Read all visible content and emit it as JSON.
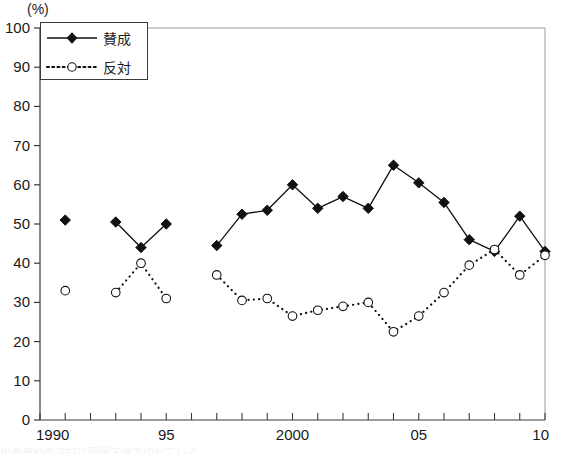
{
  "chart_data": {
    "type": "line",
    "title": "",
    "subtitle": "",
    "xlabel": "",
    "ylabel": "",
    "unit_label": "(%)",
    "xlim": [
      1990,
      2010
    ],
    "ylim": [
      0,
      100
    ],
    "grid": false,
    "legend_position": "top-left",
    "y_ticks": [
      0,
      10,
      20,
      30,
      40,
      50,
      60,
      70,
      80,
      90,
      100
    ],
    "y_tick_labels": [
      "0",
      "10",
      "20",
      "30",
      "40",
      "50",
      "60",
      "70",
      "80",
      "90",
      "100"
    ],
    "x_ticks": [
      1990,
      1991,
      1992,
      1993,
      1994,
      1995,
      1996,
      1997,
      1998,
      1999,
      2000,
      2001,
      2002,
      2003,
      2004,
      2005,
      2006,
      2007,
      2008,
      2009,
      2010
    ],
    "x_tick_labels": [
      {
        "value": 1990,
        "label": "1990"
      },
      {
        "value": 1995,
        "label": "95"
      },
      {
        "value": 2000,
        "label": "2000"
      },
      {
        "value": 2005,
        "label": "05"
      },
      {
        "value": 2010,
        "label": "10"
      }
    ],
    "series": [
      {
        "name": "賛成",
        "marker": "filled-diamond",
        "line_style": "solid",
        "color": "#111111",
        "segments": [
          {
            "x": [
              1991
            ],
            "values": [
              51
            ]
          },
          {
            "x": [
              1993,
              1994,
              1995
            ],
            "values": [
              50.5,
              44,
              50
            ]
          },
          {
            "x": [
              1997,
              1998,
              1999,
              2000,
              2001,
              2002,
              2003,
              2004,
              2005,
              2006,
              2007,
              2008,
              2009,
              2010
            ],
            "values": [
              44.5,
              52.5,
              53.5,
              60,
              54,
              57,
              54,
              65,
              60.5,
              55.5,
              46,
              43,
              52,
              43
            ]
          }
        ]
      },
      {
        "name": "反対",
        "marker": "open-circle",
        "line_style": "dotted",
        "color": "#111111",
        "segments": [
          {
            "x": [
              1991
            ],
            "values": [
              33
            ]
          },
          {
            "x": [
              1993,
              1994,
              1995
            ],
            "values": [
              32.5,
              40,
              31
            ]
          },
          {
            "x": [
              1997,
              1998,
              1999,
              2000,
              2001,
              2002,
              2003,
              2004,
              2005,
              2006,
              2007,
              2008,
              2009,
              2010
            ],
            "values": [
              37,
              30.5,
              31,
              26.5,
              28,
              29,
              30,
              22.5,
              26.5,
              32.5,
              39.5,
              43.5,
              37,
              42
            ]
          }
        ]
      }
    ]
  },
  "legend": {
    "items": [
      {
        "label": "賛成",
        "marker": "filled-diamond",
        "line_style": "solid"
      },
      {
        "label": "反対",
        "marker": "open-circle",
        "line_style": "dotted"
      }
    ]
  },
  "footer": {
    "clipped_text": "出典資料の注記は図版下端で切れている"
  }
}
